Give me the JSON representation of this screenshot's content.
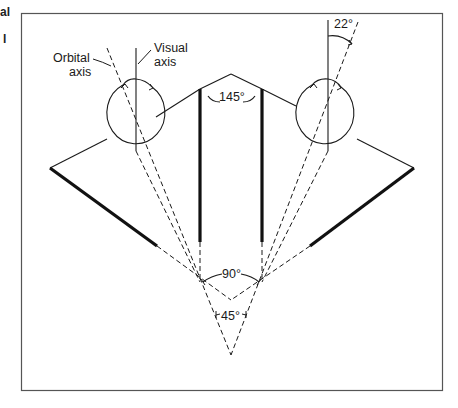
{
  "margin_fragments": [
    {
      "text": "al",
      "x": 0,
      "y": 14
    },
    {
      "text": "l",
      "x": 3,
      "y": 41
    }
  ],
  "labels": {
    "orbital_axis_line1": "Orbital",
    "orbital_axis_line2": "axis",
    "visual_axis_line1": "Visual",
    "visual_axis_line2": "axis",
    "angle_right_eye": "22°",
    "angle_nose": "145°",
    "angle_visual_axes_intersection": "90°",
    "angle_orbital_axes": "45°"
  },
  "colors": {
    "line": "#1a1a1a",
    "frame": "#555555",
    "background": "#ffffff"
  }
}
